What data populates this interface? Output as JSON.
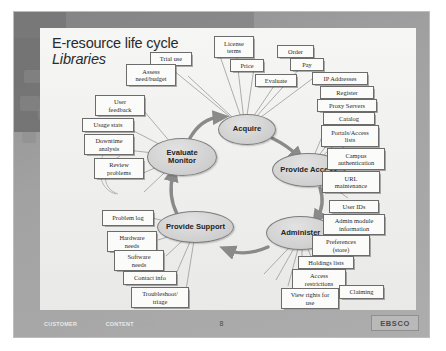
{
  "slide": {
    "title_line1": "E-resource life cycle",
    "title_line2": "Libraries",
    "page_number": "8",
    "footer": {
      "word1": "CUSTOMER",
      "word2": "FOCUSED",
      "word3": "CONTENT",
      "word4": "DRIVEN"
    },
    "brand": "EBSCO",
    "colors": {
      "frame": "#9a9a9a",
      "page_background": "#f3f3f1",
      "node_fill": "#d6d6d6",
      "node_border": "#7d7d7d",
      "box_fill": "#fbfbfa",
      "box_border": "#6c6c6c",
      "text": "#2b2b2b"
    }
  },
  "cycle": {
    "nodes": [
      {
        "id": "acquire",
        "label": "Acquire"
      },
      {
        "id": "provide-access",
        "label": "Provide Access"
      },
      {
        "id": "administer",
        "label": "Administer"
      },
      {
        "id": "provide-support",
        "label": "Provide Support"
      },
      {
        "id": "evaluate-monitor",
        "label": "Evaluate\nMonitor"
      },
      {
        "id": "evaluate-monitor-line1",
        "label": "Evaluate"
      },
      {
        "id": "evaluate-monitor-line2",
        "label": "Monitor"
      }
    ],
    "flow_order": [
      "Evaluate Monitor",
      "Acquire",
      "Provide Access",
      "Administer",
      "Provide Support",
      "Evaluate Monitor"
    ]
  },
  "boxes": {
    "acquire": [
      {
        "id": "trial-use",
        "label": "Trial use"
      },
      {
        "id": "assess-need-budget",
        "label": "Assess\nneed/budget"
      },
      {
        "id": "assess-need-budget-l1",
        "label": "Assess"
      },
      {
        "id": "assess-need-budget-l2",
        "label": "need/budget"
      },
      {
        "id": "license-terms-l1",
        "label": "License"
      },
      {
        "id": "license-terms-l2",
        "label": "terms"
      },
      {
        "id": "price",
        "label": "Price"
      },
      {
        "id": "order",
        "label": "Order"
      },
      {
        "id": "pay",
        "label": "Pay"
      },
      {
        "id": "evaluate",
        "label": "Evaluate"
      }
    ],
    "provide_access": [
      {
        "id": "ip-addresses",
        "label": "IP Addresses"
      },
      {
        "id": "register",
        "label": "Register"
      },
      {
        "id": "proxy-servers",
        "label": "Proxy Servers"
      },
      {
        "id": "catalog",
        "label": "Catalog"
      },
      {
        "id": "portals-access-lists-l1",
        "label": "Portals/Access"
      },
      {
        "id": "portals-access-lists-l2",
        "label": "lists"
      },
      {
        "id": "campus-authentication-l1",
        "label": "Campus"
      },
      {
        "id": "campus-authentication-l2",
        "label": "authentication"
      },
      {
        "id": "url-maintenance-l1",
        "label": "URL"
      },
      {
        "id": "url-maintenance-l2",
        "label": "maintenance"
      }
    ],
    "administer": [
      {
        "id": "user-ids",
        "label": "User IDs"
      },
      {
        "id": "admin-module-information-l1",
        "label": "Admin module"
      },
      {
        "id": "admin-module-information-l2",
        "label": "information"
      },
      {
        "id": "preferences-store-l1",
        "label": "Preferences"
      },
      {
        "id": "preferences-store-l2",
        "label": "(store)"
      },
      {
        "id": "holdings-lists",
        "label": "Holdings lists"
      },
      {
        "id": "access-restrictions-l1",
        "label": "Access"
      },
      {
        "id": "access-restrictions-l2",
        "label": "restrictions"
      },
      {
        "id": "view-rights-for-use-l1",
        "label": "View rights for"
      },
      {
        "id": "view-rights-for-use-l2",
        "label": "use"
      },
      {
        "id": "claiming",
        "label": "Claiming"
      }
    ],
    "provide_support": [
      {
        "id": "problem-log",
        "label": "Problem log"
      },
      {
        "id": "hardware-needs-l1",
        "label": "Hardware"
      },
      {
        "id": "hardware-needs-l2",
        "label": "needs"
      },
      {
        "id": "software-needs-l1",
        "label": "Software"
      },
      {
        "id": "software-needs-l2",
        "label": "needs"
      },
      {
        "id": "contact-info",
        "label": "Contact info"
      },
      {
        "id": "troubleshoot-triage-l1",
        "label": "Troubleshoot/"
      },
      {
        "id": "troubleshoot-triage-l2",
        "label": "triage"
      }
    ],
    "evaluate_monitor": [
      {
        "id": "user-feedback-l1",
        "label": "User"
      },
      {
        "id": "user-feedback-l2",
        "label": "feedback"
      },
      {
        "id": "usage-stats",
        "label": "Usage stats"
      },
      {
        "id": "downtime-analysis-l1",
        "label": "Downtime"
      },
      {
        "id": "downtime-analysis-l2",
        "label": "analysis"
      },
      {
        "id": "review-problems-l1",
        "label": "Review"
      },
      {
        "id": "review-problems-l2",
        "label": "problems"
      }
    ]
  }
}
